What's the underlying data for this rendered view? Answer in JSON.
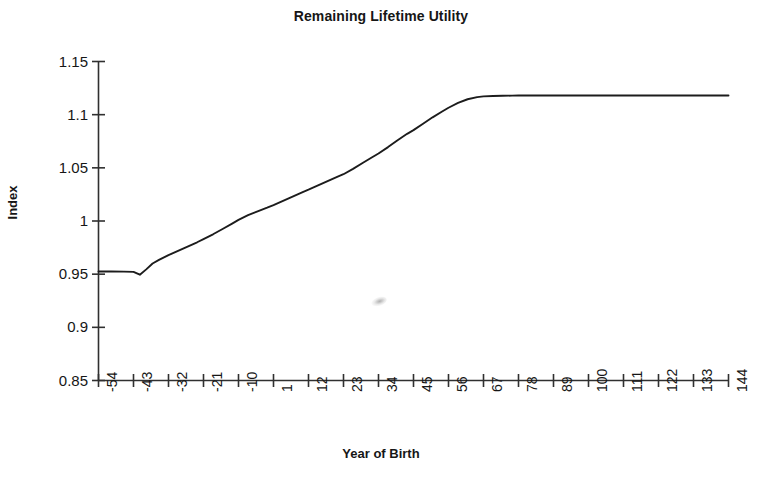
{
  "chart_data": {
    "type": "line",
    "title": "Remaining Lifetime Utility",
    "xlabel": "Year of Birth",
    "ylabel": "Index",
    "grid": false,
    "legend": false,
    "legend_position": "none",
    "xlim": [
      -54,
      144
    ],
    "ylim": [
      0.85,
      1.15
    ],
    "ytick_labels": [
      "1.15",
      "1.1",
      "1.05",
      "1",
      "0.95",
      "0.9",
      "0.85"
    ],
    "ytick_values": [
      1.15,
      1.1,
      1.05,
      1.0,
      0.95,
      0.9,
      0.85
    ],
    "xtick_labels": [
      "-54",
      "-43",
      "-32",
      "-21",
      "-10",
      "1",
      "12",
      "23",
      "34",
      "45",
      "56",
      "67",
      "78",
      "89",
      "100",
      "111",
      "122",
      "133",
      "144"
    ],
    "xtick_values": [
      -54,
      -43,
      -32,
      -21,
      -10,
      1,
      12,
      23,
      34,
      45,
      56,
      67,
      78,
      89,
      100,
      111,
      122,
      133,
      144
    ],
    "series": [
      {
        "name": "Remaining Lifetime Utility",
        "color": "#1c1c1c",
        "x": [
          -54,
          -50,
          -46,
          -43,
          -41,
          -39,
          -37,
          -35,
          -32,
          -29,
          -26,
          -23,
          -21,
          -18,
          -15,
          -12,
          -10,
          -7,
          -4,
          -1,
          1,
          4,
          7,
          10,
          12,
          15,
          18,
          21,
          23,
          26,
          29,
          32,
          34,
          37,
          40,
          43,
          45,
          48,
          51,
          54,
          56,
          59,
          62,
          65,
          67,
          70,
          73,
          76,
          78,
          85,
          89,
          100,
          111,
          122,
          133,
          144
        ],
        "values": [
          0.9525,
          0.9525,
          0.9524,
          0.9522,
          0.9495,
          0.9545,
          0.96,
          0.9635,
          0.968,
          0.972,
          0.976,
          0.98,
          0.983,
          0.9875,
          0.9925,
          0.9975,
          1.001,
          1.0055,
          1.009,
          1.0125,
          1.015,
          1.019,
          1.023,
          1.027,
          1.0295,
          1.0335,
          1.0375,
          1.0415,
          1.044,
          1.049,
          1.0545,
          1.06,
          1.0635,
          1.0695,
          1.076,
          1.082,
          1.0855,
          1.0915,
          1.0975,
          1.103,
          1.1065,
          1.111,
          1.1145,
          1.1165,
          1.1172,
          1.1176,
          1.1178,
          1.1179,
          1.118,
          1.118,
          1.118,
          1.118,
          1.118,
          1.118,
          1.118,
          1.118
        ]
      }
    ],
    "notes": {
      "start_value": "0.9525",
      "dip_value": "0.9495",
      "plateau_value": "1.118",
      "plateau_starts_near_year": "67"
    }
  }
}
